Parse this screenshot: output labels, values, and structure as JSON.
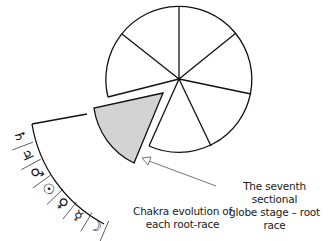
{
  "diagram": {
    "circle": {
      "sectors": 7,
      "stroke": "#111111",
      "fill": "#ffffff"
    },
    "highlighted_sector": {
      "fill": "#d0d0d0",
      "description": "seventh sector, pulled out"
    },
    "chakra_symbols": [
      {
        "name": "saturn",
        "glyph": "♄"
      },
      {
        "name": "jupiter",
        "glyph": "♃"
      },
      {
        "name": "mars",
        "glyph": "♂"
      },
      {
        "name": "sun",
        "glyph": "☉"
      },
      {
        "name": "venus",
        "glyph": "♀"
      },
      {
        "name": "mercury",
        "glyph": "☿"
      },
      {
        "name": "moon",
        "glyph": "☽"
      }
    ],
    "labels": {
      "chakra_line1": "Chakra evolution of",
      "chakra_line2": "each root-race",
      "seventh_line1": "The seventh sectional",
      "seventh_line2": "globe stage – root race"
    },
    "arrow_color": "#666666"
  }
}
